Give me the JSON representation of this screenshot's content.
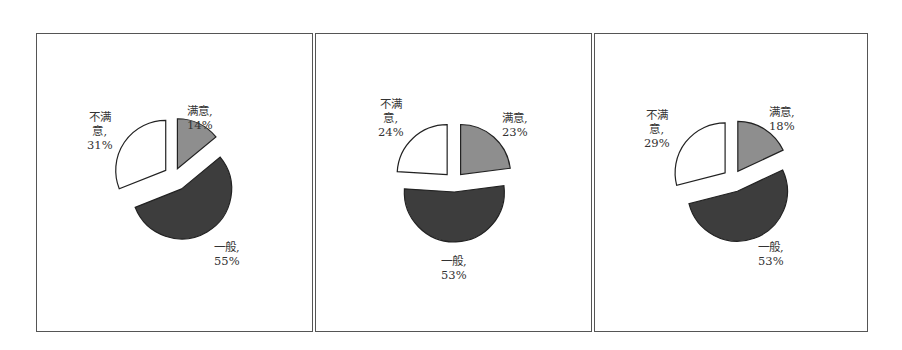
{
  "chart_data": [
    {
      "type": "pie",
      "title": "",
      "categories": [
        "满意",
        "一般",
        "不满意"
      ],
      "values": [
        14,
        55,
        31
      ],
      "labels": [
        "满意,\n14%",
        "一般,\n55%",
        "不满\n意,\n31%"
      ],
      "exploded": true,
      "start_angle": "12 o'clock, clockwise"
    },
    {
      "type": "pie",
      "title": "",
      "categories": [
        "满意",
        "一般",
        "不满意"
      ],
      "values": [
        23,
        53,
        24
      ],
      "labels": [
        "满意,\n23%",
        "一般,\n53%",
        "不满\n意,\n24%"
      ],
      "exploded": true,
      "start_angle": "12 o'clock, clockwise"
    },
    {
      "type": "pie",
      "title": "",
      "categories": [
        "满意",
        "一般",
        "不满意"
      ],
      "values": [
        18,
        53,
        29
      ],
      "labels": [
        "满意,\n18%",
        "一般,\n53%",
        "不满\n意,\n29%"
      ],
      "exploded": true,
      "start_angle": "12 o'clock, clockwise"
    }
  ],
  "colors": {
    "satisfied": "#8e8e8e",
    "general": "#3d3d3d",
    "unsatisfied": "#ffffff",
    "stroke": "#222222",
    "frame": "#555555"
  }
}
